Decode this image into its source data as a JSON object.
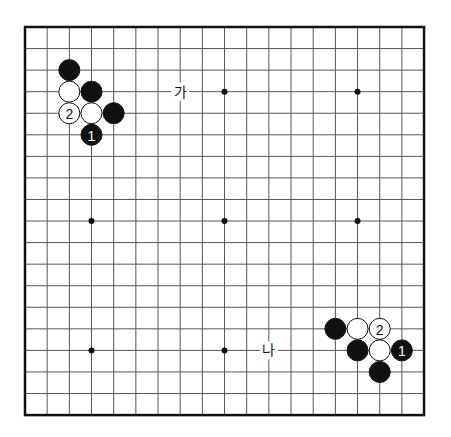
{
  "board": {
    "size": 19,
    "origin": {
      "x": 25,
      "y": 27
    },
    "spacing": {
      "x": 22.17,
      "y": 21.56
    },
    "line_color": "#555555",
    "border_color": "#111111",
    "hoshi": [
      [
        3,
        3
      ],
      [
        9,
        3
      ],
      [
        15,
        3
      ],
      [
        3,
        9
      ],
      [
        9,
        9
      ],
      [
        15,
        9
      ],
      [
        3,
        15
      ],
      [
        9,
        15
      ],
      [
        15,
        15
      ]
    ],
    "stones": [
      {
        "col": 2,
        "row": 2,
        "color": "black",
        "label": ""
      },
      {
        "col": 2,
        "row": 3,
        "color": "white",
        "label": ""
      },
      {
        "col": 3,
        "row": 3,
        "color": "black",
        "label": ""
      },
      {
        "col": 2,
        "row": 4,
        "color": "white",
        "label": "2"
      },
      {
        "col": 3,
        "row": 4,
        "color": "white",
        "label": ""
      },
      {
        "col": 4,
        "row": 4,
        "color": "black",
        "label": ""
      },
      {
        "col": 3,
        "row": 5,
        "color": "black",
        "label": "1"
      },
      {
        "col": 14,
        "row": 14,
        "color": "black",
        "label": ""
      },
      {
        "col": 15,
        "row": 14,
        "color": "white",
        "label": ""
      },
      {
        "col": 16,
        "row": 14,
        "color": "white",
        "label": "2"
      },
      {
        "col": 15,
        "row": 15,
        "color": "black",
        "label": ""
      },
      {
        "col": 16,
        "row": 15,
        "color": "white",
        "label": ""
      },
      {
        "col": 17,
        "row": 15,
        "color": "black",
        "label": "1"
      },
      {
        "col": 16,
        "row": 16,
        "color": "black",
        "label": ""
      }
    ],
    "markers": [
      {
        "col": 7,
        "row": 3,
        "text": "가"
      },
      {
        "col": 11,
        "row": 15,
        "text": "나"
      }
    ]
  }
}
